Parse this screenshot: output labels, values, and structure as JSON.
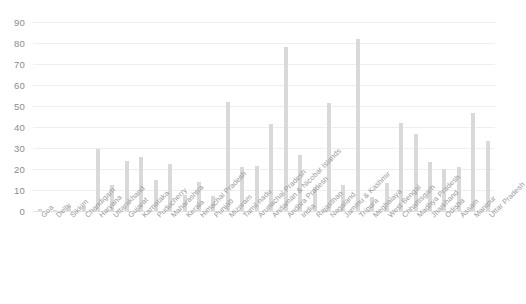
{
  "chart_data": {
    "type": "bar",
    "title": "",
    "subtitle": "",
    "xlabel": "",
    "ylabel": "",
    "ylim": [
      0,
      90
    ],
    "ytick_step": 10,
    "yticks": [
      90,
      80,
      70,
      60,
      50,
      40,
      30,
      20,
      10,
      0
    ],
    "grid": true,
    "legend": "none",
    "bar_color": "#d9d9d9",
    "gridline_color": "#efefef",
    "axis_text_color": "#8c8c8c",
    "background_color": "#ffffff",
    "categories": [
      "Goa",
      "Delhi",
      "Sikkim",
      "Chandigarh",
      "Haryana",
      "Uttarakhand",
      "Gujarat",
      "Karnataka",
      "Puducherry",
      "Maharashtra",
      "Kerala",
      "Himachal Pradesh",
      "Punjab",
      "Mizoram",
      "Tamil nadu",
      "Arunachal Pradesh",
      "Andaman & Nicobar Islands",
      "Andhra Pradesh",
      "India",
      "Rajasthan",
      "Nagaland",
      "Jammu & Kashmir",
      "Tripura",
      "Meghalaya",
      "West Bengal",
      "Chhattisgarh",
      "Madhya Pradesh",
      "Jharkhand",
      "Odisha",
      "Assam",
      "Manipur",
      "Uttar Pradesh"
    ],
    "values": [
      0.8,
      0.5,
      2.5,
      2.3,
      29.5,
      12.6,
      23.8,
      25.8,
      14.7,
      22.2,
      7.5,
      13.8,
      7.2,
      51.8,
      20.8,
      21.5,
      41.5,
      78,
      26.8,
      11.3,
      51.5,
      12.3,
      82,
      6.5,
      13.5,
      42,
      36.8,
      23.5,
      19.8,
      20.8,
      46.8,
      33.5
    ]
  }
}
